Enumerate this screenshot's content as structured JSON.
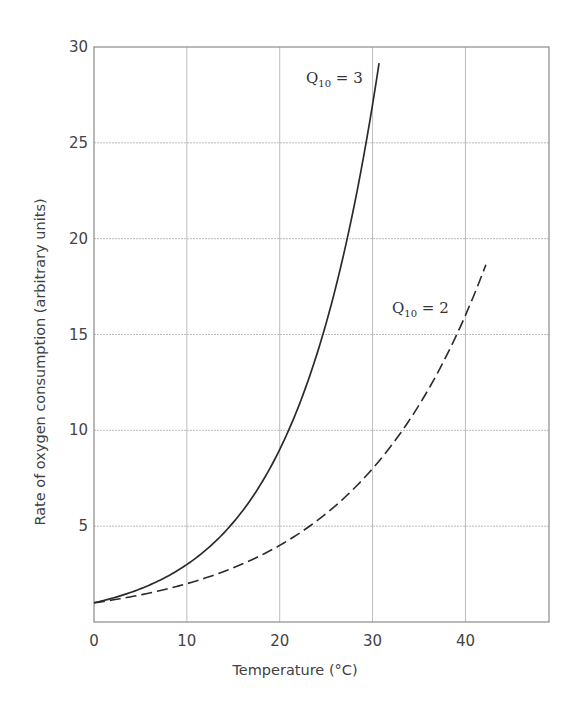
{
  "chart_data": {
    "type": "line",
    "title": "",
    "xlabel": "Temperature (°C)",
    "ylabel": "Rate of oxygen consumption (arbitrary units)",
    "xlim": [
      0,
      49
    ],
    "ylim": [
      0,
      30
    ],
    "x_ticks": [
      0,
      10,
      20,
      30,
      40
    ],
    "y_ticks": [
      5,
      10,
      15,
      20,
      25,
      30
    ],
    "grid": true,
    "legend_position": "inline labels near curve ends",
    "series": [
      {
        "name": "Q10 = 3",
        "label_main": "Q",
        "label_sub": "10",
        "label_rest": " = 3",
        "style": "solid",
        "color": "#2b2b2b",
        "formula": "3^(T/10)",
        "x": [
          0,
          5,
          10,
          15,
          20,
          25,
          28,
          30,
          30.7
        ],
        "values": [
          1.0,
          1.73,
          3.0,
          5.2,
          9.0,
          15.6,
          21.7,
          27.0,
          29.2
        ]
      },
      {
        "name": "Q10 = 2",
        "label_main": "Q",
        "label_sub": "10",
        "label_rest": " = 2",
        "style": "dashed",
        "color": "#2b2b2b",
        "formula": "2^(T/10)",
        "x": [
          0,
          5,
          10,
          15,
          20,
          25,
          30,
          35,
          40,
          42.2
        ],
        "values": [
          1.0,
          1.41,
          2.0,
          2.83,
          4.0,
          5.66,
          8.0,
          11.3,
          16.0,
          18.7
        ]
      }
    ]
  },
  "colors": {
    "grid": "#bdbdbd",
    "axis": "#8a8a8a",
    "curve": "#2b2b2b"
  }
}
